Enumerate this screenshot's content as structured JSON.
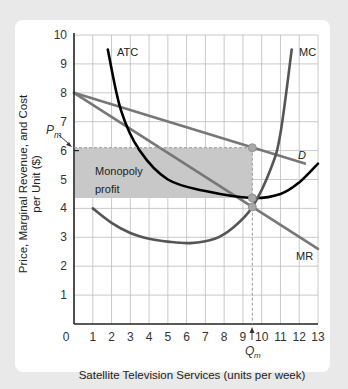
{
  "chart_data": {
    "type": "line",
    "title": "",
    "xlabel": "Satellite Television Services (units per week)",
    "ylabel_line1": "Price, Marginal Revenue, and Cost",
    "ylabel_line2": "per Unit ($)",
    "xlim": [
      0,
      13
    ],
    "ylim": [
      0,
      10
    ],
    "x_ticks": [
      "0",
      "1",
      "2",
      "3",
      "4",
      "5",
      "6",
      "7",
      "8",
      "9",
      "10",
      "11",
      "12",
      "13"
    ],
    "y_ticks": [
      "1",
      "2",
      "3",
      "4",
      "5",
      "6",
      "7",
      "8",
      "9",
      "10"
    ],
    "grid": true,
    "series": [
      {
        "name": "D",
        "label": "D",
        "color": "#777777",
        "points": [
          [
            0,
            8
          ],
          [
            9.5,
            6.1
          ],
          [
            12.3,
            5.55
          ]
        ]
      },
      {
        "name": "MR",
        "label": "MR",
        "color": "#777777",
        "points": [
          [
            0,
            8
          ],
          [
            9.5,
            4.05
          ],
          [
            13,
            2.6
          ]
        ]
      },
      {
        "name": "ATC",
        "label": "ATC",
        "color": "#000000",
        "points": [
          [
            1.8,
            9.5
          ],
          [
            2.5,
            7.4
          ],
          [
            3.5,
            6.0
          ],
          [
            5,
            5.0
          ],
          [
            7,
            4.6
          ],
          [
            9.5,
            4.36
          ],
          [
            11,
            4.5
          ],
          [
            12,
            4.9
          ],
          [
            13,
            5.55
          ]
        ]
      },
      {
        "name": "MC",
        "label": "MC",
        "color": "#555555",
        "points": [
          [
            1,
            4.0
          ],
          [
            2,
            3.5
          ],
          [
            3,
            3.15
          ],
          [
            4,
            2.95
          ],
          [
            5,
            2.85
          ],
          [
            6.2,
            2.8
          ],
          [
            7.5,
            2.95
          ],
          [
            8.5,
            3.35
          ],
          [
            9.5,
            4.05
          ],
          [
            10.5,
            5.4
          ],
          [
            11,
            6.6
          ],
          [
            11.6,
            9.5
          ]
        ]
      }
    ],
    "shaded_region": {
      "label_line1": "Monopoly",
      "label_line2": "profit",
      "x": [
        0,
        9.5
      ],
      "y": [
        4.36,
        6.1
      ],
      "color": "#c8c8c8"
    },
    "annotations": {
      "Pm": {
        "label": "P",
        "sub": "m",
        "value": 6.1
      },
      "Qm": {
        "label": "Q",
        "sub": "m",
        "value": 9.5
      },
      "points": [
        [
          9.5,
          6.1
        ],
        [
          9.5,
          4.36
        ],
        [
          9.5,
          4.05
        ]
      ]
    }
  }
}
